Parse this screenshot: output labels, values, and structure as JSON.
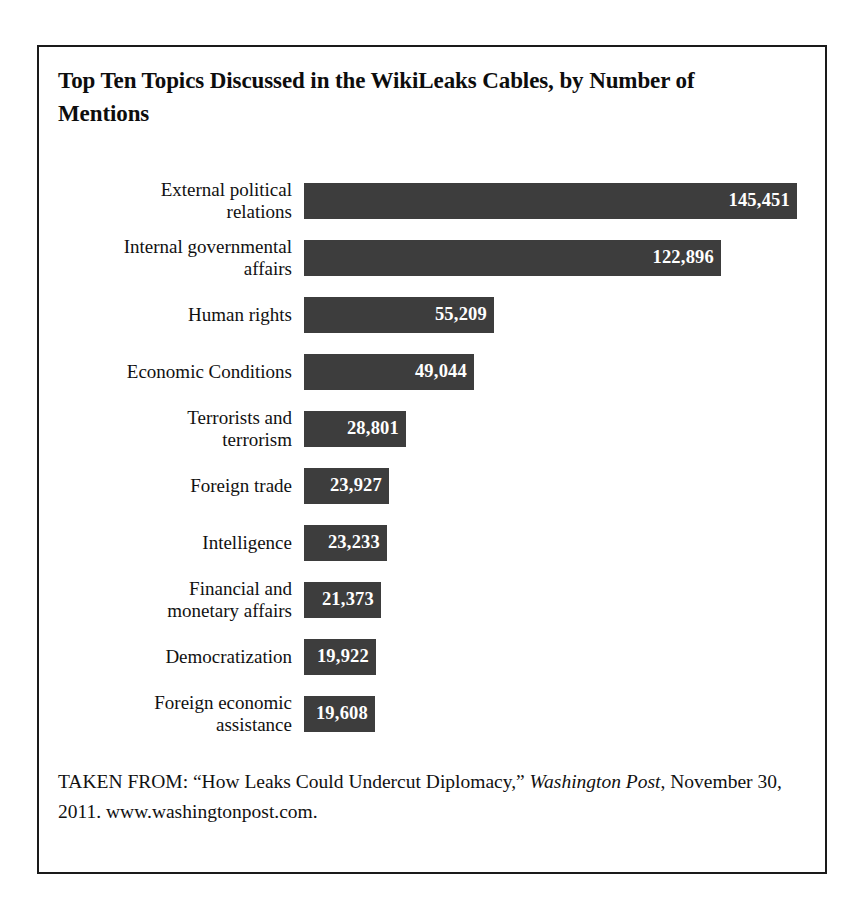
{
  "figure": {
    "title": "Top Ten Topics Discussed in the WikiLeaks Cables, by Number of Mentions",
    "source_prefix": "TAKEN FROM: “How Leaks Could Undercut Diplomacy,” ",
    "source_publication": "Washington Post",
    "source_suffix": ", November 30, 2011. www.washingtonpost.com.",
    "bar_color": "#3d3d3d",
    "value_text_color": "#ffffff",
    "frame_color": "#1a1a1a"
  },
  "chart_data": {
    "type": "bar",
    "orientation": "horizontal",
    "title": "Top Ten Topics Discussed in the WikiLeaks Cables, by Number of Mentions",
    "xlabel": "",
    "ylabel": "",
    "xlim": [
      0,
      145451
    ],
    "grid": false,
    "legend": "none",
    "data_labels": true,
    "categories": [
      "External political relations",
      "Internal governmental affairs",
      "Human rights",
      "Economic Conditions",
      "Terrorists and terrorism",
      "Foreign trade",
      "Intelligence",
      "Financial and monetary affairs",
      "Democratization",
      "Foreign economic assistance"
    ],
    "values": [
      145451,
      122896,
      55209,
      49044,
      28801,
      23927,
      23233,
      21373,
      19922,
      19608
    ],
    "value_labels": [
      "145,451",
      "122,896",
      "55,209",
      "49,044",
      "28,801",
      "23,927",
      "23,233",
      "21,373",
      "19,922",
      "19,608"
    ],
    "category_labels_wrapped": [
      "External political\nrelations",
      "Internal governmental\naffairs",
      "Human rights",
      "Economic Conditions",
      "Terrorists and\nterrorism",
      "Foreign trade",
      "Intelligence",
      "Financial and\nmonetary affairs",
      "Democratization",
      "Foreign economic\nassistance"
    ]
  }
}
